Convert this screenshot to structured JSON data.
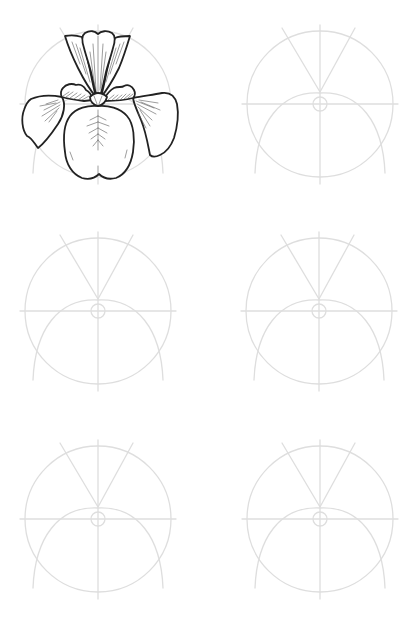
{
  "page": {
    "width": 420,
    "height": 626,
    "background": "#ffffff"
  },
  "colors": {
    "guide_stroke": "#dedede",
    "ink_stroke": "#222222",
    "hatch_stroke": "#5a5a5a",
    "petal_fill": "#ffffff"
  },
  "grid": {
    "columns": 2,
    "rows": 3,
    "panels": [
      {
        "id": "panel-1",
        "cx": 98,
        "cy": 104,
        "has_flower": true,
        "label": "Step 1 – finished iris"
      },
      {
        "id": "panel-2",
        "cx": 320,
        "cy": 104,
        "has_flower": false,
        "label": "Step 2 – guide only"
      },
      {
        "id": "panel-3",
        "cx": 98,
        "cy": 311,
        "has_flower": false,
        "label": "Step 3 – guide only"
      },
      {
        "id": "panel-4",
        "cx": 319,
        "cy": 311,
        "has_flower": false,
        "label": "Step 4 – guide only"
      },
      {
        "id": "panel-5",
        "cx": 98,
        "cy": 519,
        "has_flower": false,
        "label": "Step 5 – guide only"
      },
      {
        "id": "panel-6",
        "cx": 320,
        "cy": 519,
        "has_flower": false,
        "label": "Step 6 – guide only"
      }
    ]
  },
  "guide": {
    "circle_radius": 73,
    "center_circle_radius": 7,
    "vertical_top_offset": -79,
    "vertical_bottom_offset": 80,
    "horizontal_half_width": 78,
    "v_apex_offset_y": -12,
    "v_left_end": [
      -38,
      -76
    ],
    "v_right_end": [
      35,
      -76
    ],
    "arc_apex_offset_y": -11,
    "arc_end_offset_y": 69,
    "arc_end_half_width": 65
  }
}
